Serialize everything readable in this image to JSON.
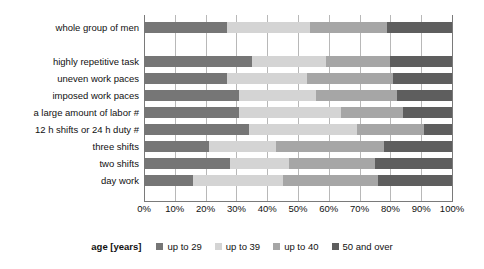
{
  "chart_data": {
    "type": "bar",
    "orientation": "horizontal",
    "stacked": true,
    "normalized": true,
    "title": "",
    "xlabel": "",
    "ylabel": "",
    "xlim": [
      0,
      100
    ],
    "grid": true,
    "legend_position": "bottom",
    "legend_title": "age [years]",
    "xtick_labels": [
      "0%",
      "10%",
      "20%",
      "30%",
      "40%",
      "50%",
      "60%",
      "70%",
      "80%",
      "90%",
      "100%"
    ],
    "xtick_values": [
      0,
      10,
      20,
      30,
      40,
      50,
      60,
      70,
      80,
      90,
      100
    ],
    "categories": [
      "whole group of men",
      "highly repetitive task",
      "uneven work paces",
      "imposed work paces",
      "a large amount of labor #",
      "12 h shifts or 24 h duty #",
      "three shifts",
      "two shifts",
      "day work"
    ],
    "series": [
      {
        "name": "up to 29",
        "color": "#767676",
        "values": [
          27,
          35,
          27,
          31,
          31,
          34,
          21,
          28,
          16
        ]
      },
      {
        "name": "up to 39",
        "color": "#d4d4d4",
        "values": [
          27,
          24,
          26,
          25,
          33,
          35,
          22,
          19,
          29
        ]
      },
      {
        "name": "up to 40",
        "color": "#a6a6a6",
        "values": [
          25,
          21,
          28,
          26,
          20,
          22,
          35,
          28,
          31
        ]
      },
      {
        "name": "50 and over",
        "color": "#5e5e5e",
        "values": [
          21,
          20,
          19,
          18,
          16,
          9,
          22,
          25,
          24
        ]
      }
    ]
  },
  "layout": {
    "row_gap_after_index": 0,
    "bar_thickness_px": 11,
    "row_pitch_px": 17,
    "first_row_top_px": 7,
    "gap_extra_px": 17
  },
  "colors": {
    "gridline": "#b8b8b8",
    "axis": "#7a7a7a",
    "text": "#111111",
    "background": "#ffffff"
  }
}
